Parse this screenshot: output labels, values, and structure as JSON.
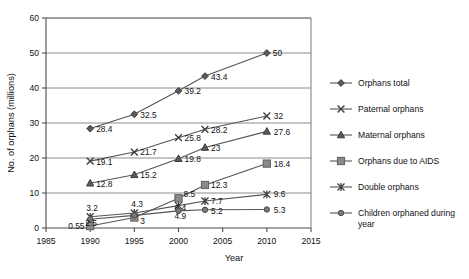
{
  "chart_data": {
    "type": "line",
    "title": "",
    "xlabel": "Year",
    "ylabel": "No. of orphans (millions)",
    "x": [
      1990,
      1995,
      2000,
      2003,
      2010
    ],
    "xlim": [
      1985,
      2015
    ],
    "ylim": [
      0,
      60
    ],
    "xticks": [
      "1985",
      "1990",
      "1995",
      "2000",
      "2005",
      "2010",
      "2015"
    ],
    "yticks": [
      "0",
      "10",
      "20",
      "30",
      "40",
      "50",
      "60"
    ],
    "grid": "horizontal",
    "legend_position": "right",
    "series": [
      {
        "name": "Orphans total",
        "marker": "diamond",
        "color": "#5a5a5a",
        "values": [
          28.4,
          32.5,
          39.2,
          43.4,
          50
        ],
        "labels": [
          "28.4",
          "32.5",
          "39.2",
          "43.4",
          "50"
        ]
      },
      {
        "name": "Paternal orphans",
        "marker": "cross",
        "color": "#5a5a5a",
        "values": [
          19.1,
          21.7,
          25.8,
          28.2,
          32
        ],
        "labels": [
          "19.1",
          "21.7",
          "25.8",
          "28.2",
          "32"
        ]
      },
      {
        "name": "Maternal orphans",
        "marker": "triangle",
        "color": "#5a5a5a",
        "values": [
          12.8,
          15.2,
          19.8,
          23,
          27.6
        ],
        "labels": [
          "12.8",
          "15.2",
          "19.8",
          "23",
          "27.6"
        ]
      },
      {
        "name": "Orphans due to AIDS",
        "marker": "square",
        "color": "#8a8a8a",
        "values": [
          0.55,
          3,
          8.5,
          12.3,
          18.4
        ],
        "labels": [
          "0.55",
          "3",
          "8.5",
          "12.3",
          "18.4"
        ]
      },
      {
        "name": "Double orphans",
        "marker": "asterisk",
        "color": "#5a5a5a",
        "values": [
          3.2,
          4.3,
          6.4,
          7.7,
          9.6
        ],
        "labels": [
          "3.2",
          "4.3",
          "6.4",
          "7.7",
          "9.6"
        ]
      },
      {
        "name": "Children orphaned during year",
        "marker": "circle",
        "color": "#7a7a7a",
        "values": [
          2.5,
          3.6,
          4.9,
          5.2,
          5.3
        ],
        "labels": [
          "2.5",
          "",
          "4.9",
          "5.2",
          "5.3"
        ]
      }
    ]
  },
  "legend": {
    "items": [
      {
        "label": "Orphans total",
        "marker": "diamond"
      },
      {
        "label": "Paternal orphans",
        "marker": "cross"
      },
      {
        "label": "Maternal orphans",
        "marker": "triangle"
      },
      {
        "label": "Orphans due to AIDS",
        "marker": "square"
      },
      {
        "label": "Double orphans",
        "marker": "asterisk"
      },
      {
        "label": "Children orphaned during year",
        "marker": "circle"
      }
    ]
  },
  "axis": {
    "y_title": "No. of orphans (millions)",
    "x_title": "Year"
  }
}
